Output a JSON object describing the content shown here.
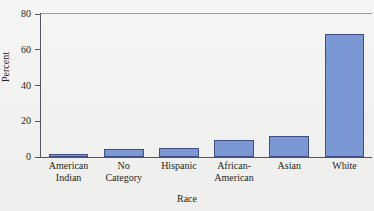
{
  "chart_data": {
    "type": "bar",
    "title": "",
    "xlabel": "Race",
    "ylabel": "Percent",
    "categories": [
      "American Indian",
      "No Category",
      "Hispanic",
      "African-American",
      "Asian",
      "White"
    ],
    "category_lines": [
      [
        "American",
        "Indian"
      ],
      [
        "No",
        "Category"
      ],
      [
        "Hispanic",
        ""
      ],
      [
        "African-",
        "American"
      ],
      [
        "Asian",
        ""
      ],
      [
        "White",
        ""
      ]
    ],
    "values": [
      1.7,
      4.5,
      5,
      9.5,
      12,
      69
    ],
    "ylim": [
      0,
      80
    ],
    "yticks": [
      0,
      20,
      40,
      60,
      80
    ],
    "ytick_labels": [
      "0",
      "20",
      "40",
      "60",
      "80"
    ],
    "grid": false,
    "legend": false,
    "bar_fill_color": "#7b97d4",
    "bar_border_color": "#3f4f86",
    "axis_color": "#56565c",
    "background_color": "#f3f3f1"
  }
}
